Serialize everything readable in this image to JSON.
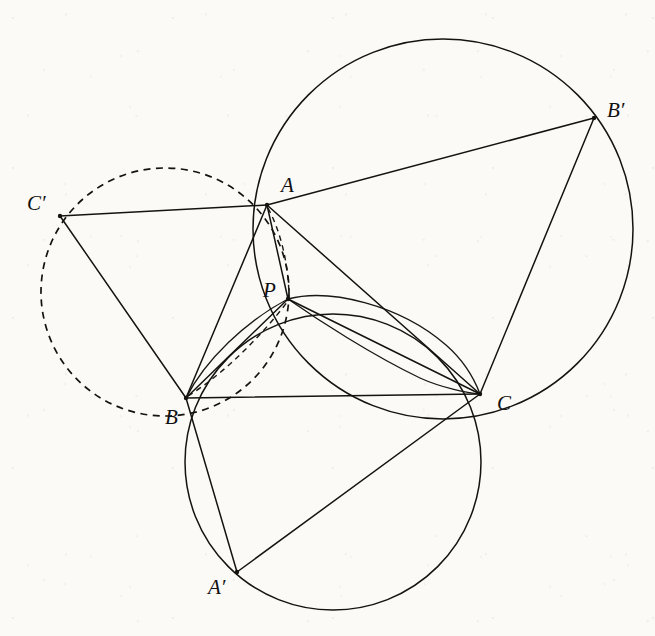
{
  "figure": {
    "background_color": "#fbfaf7",
    "ink_color": "#15130f",
    "labels": {
      "A": "A",
      "B": "B",
      "C": "C",
      "A_prime": "A′",
      "B_prime": "B′",
      "C_prime": "C′",
      "P": "P"
    },
    "points": [
      {
        "name": "A",
        "label": "A",
        "x": 267,
        "y": 205,
        "label_x": 281,
        "label_y": 192
      },
      {
        "name": "B",
        "label": "B",
        "x": 186,
        "y": 398,
        "label_x": 165,
        "label_y": 424
      },
      {
        "name": "C",
        "label": "C",
        "x": 480,
        "y": 394,
        "label_x": 497,
        "label_y": 410
      },
      {
        "name": "P",
        "label": "P",
        "x": 288,
        "y": 299,
        "label_x": 263,
        "label_y": 297
      },
      {
        "name": "Ap",
        "label": "A′",
        "x": 237,
        "y": 572,
        "label_x": 208,
        "label_y": 594
      },
      {
        "name": "Bp",
        "label": "B′",
        "x": 594,
        "y": 118,
        "label_x": 607,
        "label_y": 117
      },
      {
        "name": "Cp",
        "label": "C′",
        "x": 60,
        "y": 216,
        "label_x": 27,
        "label_y": 210
      }
    ],
    "circles": [
      {
        "name": "circumcircle-AB'C",
        "style": "solid",
        "cx": 443,
        "cy": 229,
        "r": 190
      },
      {
        "name": "circumcircle-BA'C",
        "style": "solid",
        "cx": 333,
        "cy": 462,
        "r": 148
      },
      {
        "name": "circumcircle-AC'B",
        "style": "dashed",
        "cx": 165,
        "cy": 292,
        "r": 124
      },
      {
        "name": "circumcircle-BPC",
        "style": "solid",
        "cx": 334,
        "cy": 391,
        "r": 96
      }
    ],
    "segments": [
      {
        "name": "BC",
        "from": "B",
        "to": "C",
        "style": "solid"
      },
      {
        "name": "AB",
        "from": "A",
        "to": "B",
        "style": "solid"
      },
      {
        "name": "AC",
        "from": "A",
        "to": "C",
        "style": "solid"
      },
      {
        "name": "AP",
        "from": "A",
        "to": "P",
        "style": "solid"
      },
      {
        "name": "BP",
        "from": "B",
        "to": "P",
        "style": "solid"
      },
      {
        "name": "CP",
        "from": "C",
        "to": "P",
        "style": "solid"
      },
      {
        "name": "AB'",
        "from": "A",
        "to": "Bp",
        "style": "solid"
      },
      {
        "name": "CB'",
        "from": "C",
        "to": "Bp",
        "style": "solid"
      },
      {
        "name": "AC'",
        "from": "A",
        "to": "Cp",
        "style": "solid"
      },
      {
        "name": "BC'",
        "from": "B",
        "to": "Cp",
        "style": "solid"
      },
      {
        "name": "BA'",
        "from": "B",
        "to": "Ap",
        "style": "solid"
      },
      {
        "name": "CA'",
        "from": "C",
        "to": "Ap",
        "style": "solid"
      },
      {
        "name": "BP-dashed",
        "from": "B",
        "to": "P",
        "style": "dashed"
      }
    ],
    "arcs": [
      {
        "name": "arc-A-P-dashed",
        "style": "dashed",
        "from": "A",
        "to": "P"
      }
    ],
    "caption": ""
  }
}
